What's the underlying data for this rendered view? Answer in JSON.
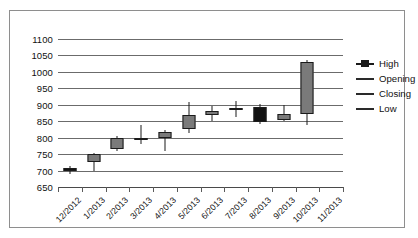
{
  "chart_data": {
    "type": "candlestick",
    "title": "",
    "xlabel": "",
    "ylabel": "",
    "ylim": [
      650,
      1100
    ],
    "ytick_step": 50,
    "yticks": [
      650,
      700,
      750,
      800,
      850,
      900,
      950,
      1000,
      1050,
      1100
    ],
    "ytick_labels": [
      "650",
      "700",
      "750",
      "800",
      "850",
      "900",
      "950",
      "1000",
      "1050",
      "1100"
    ],
    "grid": true,
    "legend_position": "right",
    "legend": [
      {
        "label": "High",
        "marker": "high-low-marker"
      },
      {
        "label": "Opening",
        "marker": "line-marker"
      },
      {
        "label": "Closing",
        "marker": "line-marker"
      },
      {
        "label": "Low",
        "marker": "line-marker"
      }
    ],
    "categories": [
      "12/2012",
      "1/2013",
      "2/2013",
      "3/2013",
      "4/2013",
      "5/2013",
      "6/2013",
      "7/2013",
      "8/2013",
      "9/2013",
      "10/2013",
      "11/2013"
    ],
    "series": [
      {
        "name": "Price",
        "points": [
          {
            "x": "12/2012",
            "high": 715,
            "open": 700,
            "close": 707,
            "low": 688,
            "direction": "up"
          },
          {
            "x": "1/2013",
            "high": 753,
            "open": 750,
            "close": 725,
            "low": 700,
            "direction": "up"
          },
          {
            "x": "2/2013",
            "high": 805,
            "open": 765,
            "close": 800,
            "low": 760,
            "direction": "up"
          },
          {
            "x": "3/2013",
            "high": 840,
            "open": 793,
            "close": 800,
            "low": 782,
            "direction": "down"
          },
          {
            "x": "4/2013",
            "high": 822,
            "open": 798,
            "close": 818,
            "low": 760,
            "direction": "up"
          },
          {
            "x": "5/2013",
            "high": 908,
            "open": 827,
            "close": 868,
            "low": 815,
            "direction": "up"
          },
          {
            "x": "6/2013",
            "high": 895,
            "open": 870,
            "close": 880,
            "low": 850,
            "direction": "up"
          },
          {
            "x": "7/2013",
            "high": 912,
            "open": 886,
            "close": 890,
            "low": 862,
            "direction": "down"
          },
          {
            "x": "8/2013",
            "high": 903,
            "open": 893,
            "close": 848,
            "low": 843,
            "direction": "down"
          },
          {
            "x": "9/2013",
            "high": 900,
            "open": 855,
            "close": 872,
            "low": 850,
            "direction": "up"
          },
          {
            "x": "10/2013",
            "high": 1037,
            "open": 873,
            "close": 1030,
            "low": 840,
            "direction": "up"
          },
          {
            "x": "11/2013",
            "high": null,
            "open": null,
            "close": null,
            "low": null,
            "direction": null
          }
        ]
      }
    ],
    "colors": {
      "up_body": "#7a7a7a",
      "down_body": "#121212",
      "outline": "#1a1a1a",
      "gridline": "#6b6b6b",
      "frame": "#8e8e8e",
      "text": "#111111",
      "background": "#ffffff"
    }
  }
}
